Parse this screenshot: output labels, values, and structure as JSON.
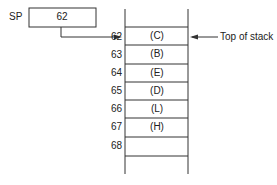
{
  "sp": {
    "label": "SP",
    "value": "62",
    "points_to": "62"
  },
  "stack": {
    "rows": [
      {
        "addr": "62",
        "content": "(C)"
      },
      {
        "addr": "63",
        "content": "(B)"
      },
      {
        "addr": "64",
        "content": "(E)"
      },
      {
        "addr": "65",
        "content": "(D)"
      },
      {
        "addr": "66",
        "content": "(L)"
      },
      {
        "addr": "67",
        "content": "(H)"
      },
      {
        "addr": "68",
        "content": ""
      }
    ],
    "top_label": "Top of stack"
  }
}
